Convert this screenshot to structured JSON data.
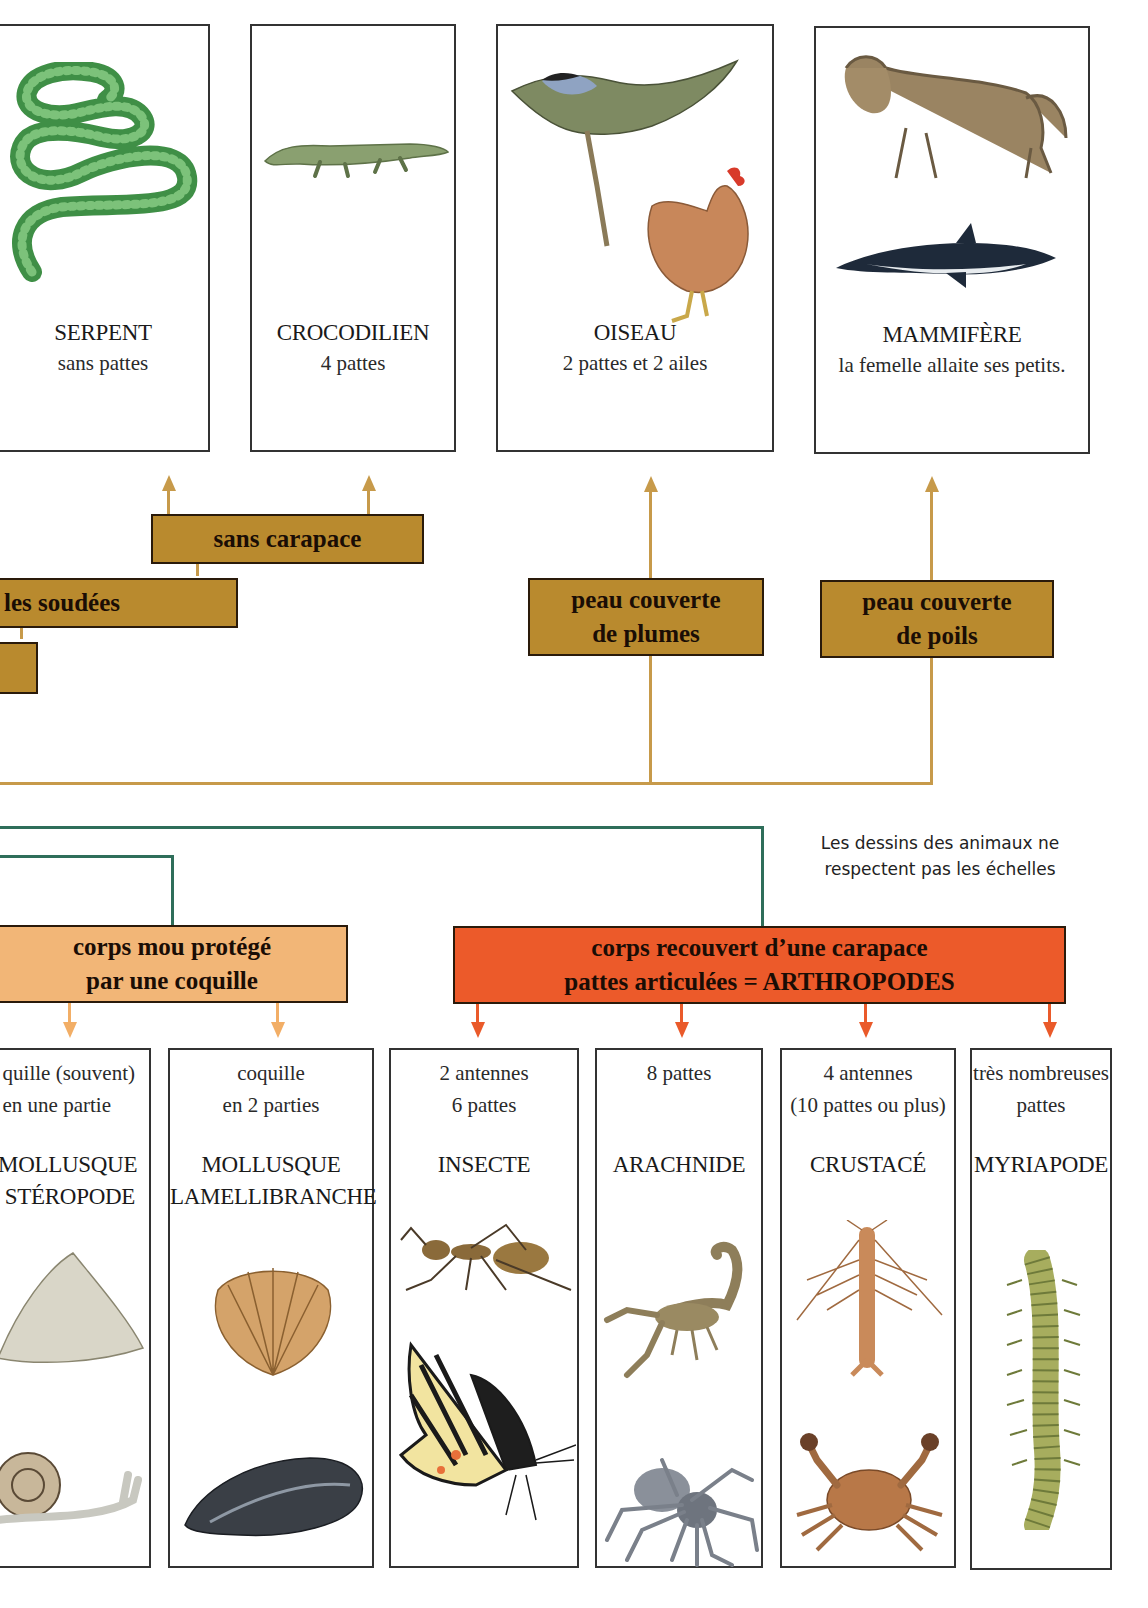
{
  "top_cards": [
    {
      "name": "serpent",
      "title": "SERPENT",
      "subtitle": "sans pattes",
      "illustration": "snake-icon"
    },
    {
      "name": "crocodilien",
      "title": "CROCODILIEN",
      "subtitle": "4 pattes",
      "illustration": "crocodile-icon"
    },
    {
      "name": "oiseau",
      "title": "OISEAU",
      "subtitle": "2 pattes et 2 ailes",
      "illustration": "bird-icon"
    },
    {
      "name": "mammifere",
      "title": "MAMMIFÈRE",
      "subtitle": "la femelle allaite ses petits.",
      "illustration": "mammal-icon"
    }
  ],
  "trait_boxes": {
    "sans_carapace": "sans carapace",
    "soudees": "les soudées",
    "plumes_l1": "peau couverte",
    "plumes_l2": "de plumes",
    "poils_l1": "peau couverte",
    "poils_l2": "de poils",
    "coquille_l1": "corps mou protégé",
    "coquille_l2": "par une coquille",
    "arthro_l1": "corps recouvert d’une carapace",
    "arthro_l2": "pattes articulées = ARTHROPODES"
  },
  "note": {
    "line1": "Les dessins des animaux ne",
    "line2": "respectent pas les échelles"
  },
  "bottom_cards": [
    {
      "name": "gasteropode",
      "desc1": "quille (souvent)",
      "desc2": "en une partie",
      "title1": "MOLLUSQUE",
      "title2": "STÉROPODE",
      "illustrations": [
        "limpet-icon",
        "snail-icon"
      ]
    },
    {
      "name": "lamellibranche",
      "desc1": "coquille",
      "desc2": "en 2 parties",
      "title1": "MOLLUSQUE",
      "title2": "LAMELLIBRANCHE",
      "illustrations": [
        "scallop-icon",
        "mussel-icon"
      ]
    },
    {
      "name": "insecte",
      "desc1": "2 antennes",
      "desc2": "6 pattes",
      "title1": "INSECTE",
      "title2": "",
      "illustrations": [
        "ant-icon",
        "butterfly-icon"
      ]
    },
    {
      "name": "arachnide",
      "desc1": "8 pattes",
      "desc2": "",
      "title1": "ARACHNIDE",
      "title2": "",
      "illustrations": [
        "scorpion-icon",
        "spider-icon"
      ]
    },
    {
      "name": "crustace",
      "desc1": "4 antennes",
      "desc2": "(10 pattes ou plus)",
      "title1": "CRUSTACÉ",
      "title2": "",
      "illustrations": [
        "shrimp-icon",
        "crab-icon"
      ]
    },
    {
      "name": "myriapode",
      "desc1": "très nombreuses",
      "desc2": "pattes",
      "title1": "MYRIAPODE",
      "title2": "",
      "illustrations": [
        "millipede-icon"
      ]
    }
  ],
  "colors": {
    "brown": "#b98a2e",
    "peach": "#f2b677",
    "red": "#ec5a2a",
    "branch_brown": "#c79a4a",
    "branch_green": "#2f6e5a"
  }
}
